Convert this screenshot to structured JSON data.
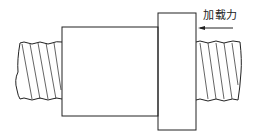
{
  "diagram": {
    "type": "ball-screw-nut-loading",
    "labels": {
      "load_force": "加载力"
    },
    "colors": {
      "stroke": "#222222",
      "background": "#ffffff"
    },
    "parts": [
      {
        "id": "left-screw-shaft",
        "kind": "threaded-shaft"
      },
      {
        "id": "nut-body",
        "kind": "cylinder"
      },
      {
        "id": "nut-flange",
        "kind": "flange"
      },
      {
        "id": "right-screw-shaft",
        "kind": "threaded-shaft"
      },
      {
        "id": "load-arrow",
        "kind": "arrow",
        "direction": "left"
      }
    ]
  }
}
